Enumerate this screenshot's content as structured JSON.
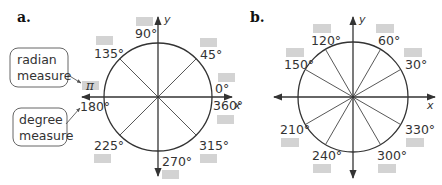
{
  "figure": {
    "parts": [
      {
        "label": "a.",
        "center": [
          158,
          97
        ],
        "radius": 54,
        "angles": [
          "90°",
          "45°",
          "0°",
          "360°",
          "135°",
          "180°",
          "225°",
          "270°",
          "315°"
        ],
        "radian_example": "π",
        "callouts": {
          "radian": [
            "radian",
            "measure"
          ],
          "degree": [
            "degree",
            "measure"
          ]
        }
      },
      {
        "label": "b.",
        "center": [
          353,
          97
        ],
        "radius": 55,
        "angles": [
          "120°",
          "60°",
          "150°",
          "30°",
          "210°",
          "330°",
          "240°",
          "300°"
        ]
      }
    ],
    "axes": {
      "x": "x",
      "y": "y"
    },
    "colors": {
      "line": "#333333",
      "blank_box": "#d3d3d3",
      "callout_border": "#666666"
    }
  }
}
